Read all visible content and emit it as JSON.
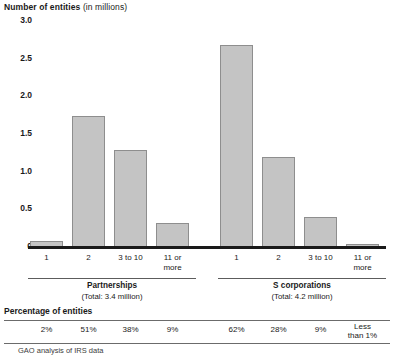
{
  "chart_data": {
    "type": "bar",
    "title": "Number of entities (in millions)",
    "title_bold_part": "Number of entities",
    "title_light_part": " (in millions)",
    "ylabel": "Number of entities (in millions)",
    "xlabel": "",
    "ylim": [
      0,
      3.0
    ],
    "ytick_labels": [
      "0",
      "0.5",
      "1.0",
      "1.5",
      "2.0",
      "2.5",
      "3.0"
    ],
    "ytick_values": [
      0,
      0.5,
      1.0,
      1.5,
      2.0,
      2.5,
      3.0
    ],
    "grid": false,
    "legend": "none",
    "categories": [
      "1",
      "2",
      "3 to 10",
      "11 or more"
    ],
    "groups": [
      {
        "name": "Partnerships",
        "total_label": "(Total: 3.4 million)",
        "total_millions": 3.4,
        "values": [
          0.06,
          1.72,
          1.27,
          0.3
        ],
        "percent_labels": [
          "2%",
          "51%",
          "38%",
          "9%"
        ]
      },
      {
        "name": "S corporations",
        "total_label": "(Total: 4.2 million)",
        "total_millions": 4.2,
        "values": [
          2.67,
          1.18,
          0.39,
          0.01
        ],
        "percent_labels": [
          "62%",
          "28%",
          "9%",
          "Less than 1%"
        ]
      }
    ],
    "bar_color": "#c4c4c4",
    "bar_border_color": "#8e8e8e",
    "axis_color": "#1a1a1a"
  },
  "percentage_section": {
    "title": "Percentage of entities"
  },
  "source": {
    "note": "GAO analysis of IRS data"
  }
}
